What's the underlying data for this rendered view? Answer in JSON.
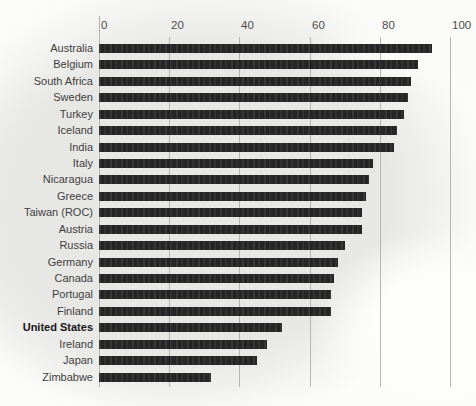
{
  "chart_data": {
    "type": "bar",
    "orientation": "horizontal",
    "title": "",
    "xlabel": "",
    "ylabel": "",
    "xlim": [
      0,
      100
    ],
    "x_ticks": [
      "0",
      "20",
      "40",
      "60",
      "80",
      "100"
    ],
    "x_tick_values": [
      0,
      20,
      40,
      60,
      80,
      100
    ],
    "grid": "vertical-gridlines",
    "legend": "none",
    "categories": [
      "Australia",
      "Belgium",
      "South Africa",
      "Sweden",
      "Turkey",
      "Iceland",
      "India",
      "Italy",
      "Nicaragua",
      "Greece",
      "Taiwan (ROC)",
      "Austria",
      "Russia",
      "Germany",
      "Canada",
      "Portugal",
      "Finland",
      "United States",
      "Ireland",
      "Japan",
      "Zimbabwe"
    ],
    "values": [
      95,
      91,
      89,
      88,
      87,
      85,
      84,
      78,
      77,
      76,
      75,
      75,
      70,
      68,
      67,
      66,
      66,
      52,
      48,
      45,
      32
    ],
    "emphasized_category": "United States",
    "bar_color": "#282828",
    "gridline_color": "#b5b5b2",
    "background_color": "#e7e7e5",
    "page_color": "#fcfcfb",
    "label_color": "#3e3e3c",
    "tick_label_color": "#4d4d4b"
  }
}
